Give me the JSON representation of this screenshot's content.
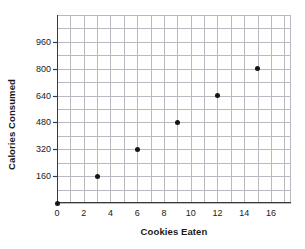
{
  "chart_data": {
    "type": "scatter",
    "title": "",
    "xlabel": "Cookies Eaten",
    "ylabel": "Calories Consumed",
    "x": [
      0,
      3,
      6,
      9,
      12,
      15
    ],
    "values": [
      0,
      160,
      320,
      480,
      640,
      800
    ],
    "points": [
      {
        "x": 0,
        "y": 0
      },
      {
        "x": 3,
        "y": 160
      },
      {
        "x": 6,
        "y": 320
      },
      {
        "x": 9,
        "y": 480
      },
      {
        "x": 12,
        "y": 640
      },
      {
        "x": 15,
        "y": 800
      }
    ],
    "xlim": [
      0,
      17.5
    ],
    "ylim": [
      0,
      1120
    ],
    "x_tick_labels": [
      "0",
      "2",
      "4",
      "6",
      "8",
      "10",
      "12",
      "14",
      "16"
    ],
    "x_tick_values": [
      0,
      2,
      4,
      6,
      8,
      10,
      12,
      14,
      16
    ],
    "y_tick_labels": [
      "160",
      "320",
      "480",
      "640",
      "800",
      "960"
    ],
    "y_tick_values": [
      160,
      320,
      480,
      640,
      800,
      960
    ],
    "x_grid_step": 1,
    "y_grid_step": 80,
    "grid": true,
    "legend": "none",
    "marker_color": "#151515",
    "grid_color": "#b9b9c2",
    "axis_color": "#3a3a3a"
  }
}
